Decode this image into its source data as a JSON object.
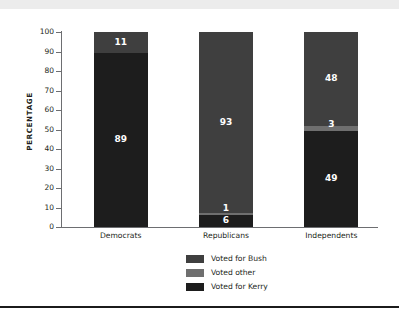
{
  "chart_data": {
    "type": "bar",
    "subtype": "stacked-bar-100",
    "title": "",
    "xlabel": "",
    "ylabel": "PERCENTAGE",
    "ylim": [
      0,
      100
    ],
    "ytick_step": 10,
    "yticks": [
      100,
      90,
      80,
      70,
      60,
      50,
      40,
      30,
      20,
      10,
      0
    ],
    "grid": false,
    "legend_position": "bottom-center",
    "categories": [
      "Democrats",
      "Republicans",
      "Independents"
    ],
    "series": [
      {
        "name": "Voted for Bush",
        "color": "#3f3f3f",
        "values": [
          11,
          93,
          48
        ]
      },
      {
        "name": "Voted other",
        "color": "#6f6f6f",
        "values": [
          0,
          1,
          3
        ]
      },
      {
        "name": "Voted for Kerry",
        "color": "#1d1d1d",
        "values": [
          89,
          6,
          49
        ]
      }
    ],
    "bars": [
      {
        "category": "Democrats",
        "segments": [
          {
            "series": "Voted for Bush",
            "value": 11,
            "label": "11",
            "show_label": true
          },
          {
            "series": "Voted for Kerry",
            "value": 89,
            "label": "89",
            "show_label": true
          }
        ]
      },
      {
        "category": "Republicans",
        "segments": [
          {
            "series": "Voted for Bush",
            "value": 93,
            "label": "93",
            "show_label": true
          },
          {
            "series": "Voted other",
            "value": 1,
            "label": "1",
            "show_label": true
          },
          {
            "series": "Voted for Kerry",
            "value": 6,
            "label": "6",
            "show_label": true
          }
        ]
      },
      {
        "category": "Independents",
        "segments": [
          {
            "series": "Voted for Bush",
            "value": 48,
            "label": "48",
            "show_label": true
          },
          {
            "series": "Voted other",
            "value": 3,
            "label": "3",
            "show_label": true
          },
          {
            "series": "Voted for Kerry",
            "value": 49,
            "label": "49",
            "show_label": true
          }
        ]
      }
    ]
  },
  "legend": {
    "items": [
      {
        "label": "Voted for Bush",
        "color": "#3f3f3f"
      },
      {
        "label": "Voted other",
        "color": "#6f6f6f"
      },
      {
        "label": "Voted for Kerry",
        "color": "#1d1d1d"
      }
    ]
  },
  "decor": {
    "top_band_color": "#ececec",
    "bottom_rule_color": "#1b1b1b",
    "axis_color": "#6d6e71",
    "text_color": "#231f20",
    "label_text_color": "#ffffff"
  }
}
